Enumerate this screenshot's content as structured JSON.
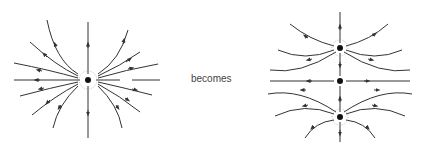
{
  "caption": "becomes",
  "colors": {
    "line": "#333333",
    "charge": "#111111",
    "dots": "#888888"
  },
  "left_figure": {
    "label": "single charge field lines",
    "charges": [
      {
        "x": 88,
        "y": 80
      }
    ]
  },
  "right_figure": {
    "label": "three charges field lines",
    "charges": [
      {
        "x": 340,
        "y": 48
      },
      {
        "x": 340,
        "y": 81
      },
      {
        "x": 340,
        "y": 117
      }
    ]
  }
}
